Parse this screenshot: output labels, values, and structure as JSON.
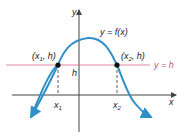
{
  "diagram": {
    "axes": {
      "x_label": "x",
      "y_label": "y"
    },
    "curve_label": "y = f(x)",
    "horizontal_line_label": "y = h",
    "h_label": "h",
    "points": [
      {
        "label_main": "(x",
        "sub": "1",
        "label_rest": ", h)",
        "axis_label": "x",
        "axis_sub": "1"
      },
      {
        "label_main": "(x",
        "sub": "2",
        "label_rest": ", h)",
        "axis_label": "x",
        "axis_sub": "2"
      }
    ],
    "colors": {
      "curve": "#2f8fc8",
      "hline": "#d46a8a",
      "axis": "#444444"
    }
  }
}
